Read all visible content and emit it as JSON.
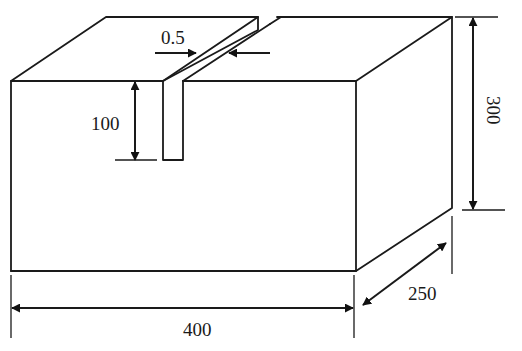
{
  "figure": {
    "colors": {
      "line": "#1a1a1a",
      "background": "#ffffff"
    }
  },
  "dimensions": {
    "slot_width": {
      "label": "0.5"
    },
    "slot_depth": {
      "label": "100"
    },
    "height": {
      "label": "300"
    },
    "length": {
      "label": "400"
    },
    "depth": {
      "label": "250"
    }
  }
}
